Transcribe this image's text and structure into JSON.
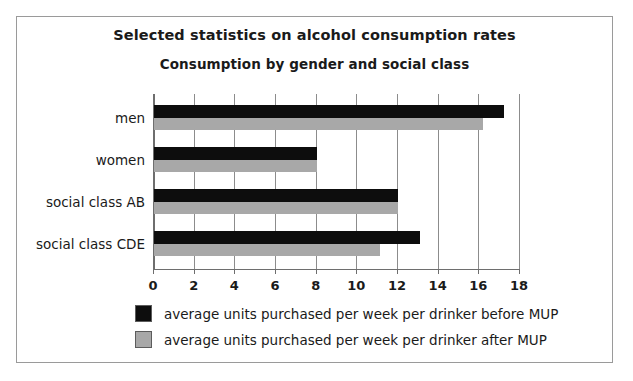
{
  "chart_data": {
    "type": "bar",
    "orientation": "horizontal",
    "title": "Selected statistics on alcohol consumption rates",
    "subtitle": "Consumption by gender and social class",
    "xlabel": "",
    "ylabel": "",
    "xlim": [
      0,
      18
    ],
    "xticks": [
      0,
      2,
      4,
      6,
      8,
      10,
      12,
      14,
      16,
      18
    ],
    "xtick_labels": [
      "0",
      "2",
      "4",
      "6",
      "8",
      "10",
      "12",
      "14",
      "16",
      "18"
    ],
    "grid": true,
    "grid_axis": "x",
    "legend_position": "bottom",
    "categories": [
      "men",
      "women",
      "social class AB",
      "social class CDE"
    ],
    "series": [
      {
        "name": "average units purchased per week per drinker before MUP",
        "color": "#0d0d0d",
        "values": [
          17.2,
          8,
          12,
          13.1
        ]
      },
      {
        "name": "average units purchased per week per drinker after MUP",
        "color": "#a8a8a8",
        "values": [
          16.2,
          8,
          12,
          11.1
        ]
      }
    ]
  },
  "legend": {
    "items": [
      {
        "label": "average units purchased per week per drinker before MUP",
        "swatch": "before"
      },
      {
        "label": "average units purchased per week per drinker after MUP",
        "swatch": "after"
      }
    ]
  }
}
